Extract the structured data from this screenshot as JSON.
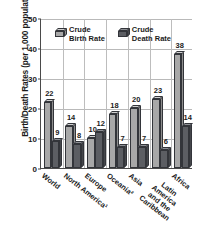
{
  "chart_data": {
    "type": "bar",
    "title": "",
    "xlabel": "",
    "ylabel": "Birth/Death Rates (per 1,000 population)",
    "ylim": [
      0,
      50
    ],
    "yticks": [
      0,
      10,
      20,
      30,
      40,
      50
    ],
    "grid": true,
    "legend_position": "top-center",
    "categories": [
      "World",
      "North America¹",
      "Europe",
      "Oceania²",
      "Asia",
      "Latin America\nand the\nCaribbean",
      "Africa"
    ],
    "series": [
      {
        "name": "Crude Birth Rate",
        "values": [
          22,
          14,
          10,
          18,
          20,
          23,
          38
        ],
        "color": "#a8a8a8"
      },
      {
        "name": "Crude Death Rate",
        "values": [
          9,
          8,
          12,
          7,
          7,
          6,
          14
        ],
        "color": "#5c5e63"
      }
    ]
  },
  "legend": {
    "items": [
      {
        "label": "Crude\nBirth Rate",
        "swatch": "birth-rate-swatch"
      },
      {
        "label": "Crude\nDeath Rate",
        "swatch": "death-rate-swatch"
      }
    ]
  },
  "axis": {
    "y_title": "Birth/Death Rates (per 1,000 population)",
    "y_tick_labels": [
      "50",
      "40",
      "30",
      "20",
      "10",
      "0"
    ]
  }
}
